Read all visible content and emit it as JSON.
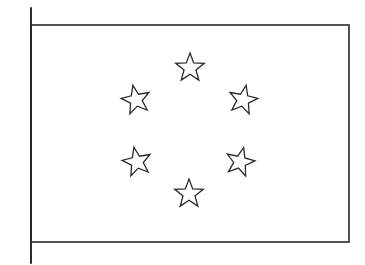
{
  "figure": {
    "line_color": "#2a2a2a",
    "background": "#ffffff",
    "pole": {
      "x": 31,
      "y1": 8,
      "y2": 263
    },
    "flag": {
      "x": 31,
      "y": 25,
      "width": 318,
      "height": 217
    },
    "stars": [
      {
        "name": "star-top",
        "cx": 190,
        "cy": 68,
        "r": 15,
        "rotate": 0
      },
      {
        "name": "star-upper-left",
        "cx": 136,
        "cy": 100,
        "r": 15,
        "rotate": -12
      },
      {
        "name": "star-upper-right",
        "cx": 243,
        "cy": 100,
        "r": 15,
        "rotate": 12
      },
      {
        "name": "star-lower-left",
        "cx": 137,
        "cy": 162,
        "r": 15,
        "rotate": -12
      },
      {
        "name": "star-lower-right",
        "cx": 240,
        "cy": 162,
        "r": 15,
        "rotate": 14
      },
      {
        "name": "star-bottom",
        "cx": 189,
        "cy": 194,
        "r": 15,
        "rotate": 0
      }
    ]
  }
}
